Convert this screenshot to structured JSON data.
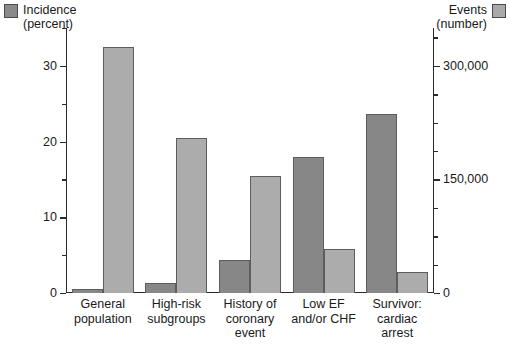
{
  "legend": {
    "left": {
      "label": "Incidence\n(percent)",
      "swatch": "legend-swatch-incidence",
      "color": "#8a8a8a"
    },
    "right": {
      "label": "Events\n(number)",
      "swatch": "legend-swatch-events",
      "color": "#a9a9a9"
    }
  },
  "axes": {
    "left": {
      "title": "Incidence (percent)",
      "major_ticks": [
        "0",
        "10",
        "20",
        "30"
      ],
      "minor_values": [
        5,
        15,
        25,
        35
      ],
      "min": 0,
      "max": 35
    },
    "right": {
      "title": "Events (number)",
      "major_ticks": [
        "0",
        "150,000",
        "300,000"
      ],
      "minor_values": [
        37500,
        75000,
        112500,
        187500,
        225000,
        262500,
        337500
      ],
      "min": 0,
      "max": 350000
    }
  },
  "chart_data": {
    "type": "bar",
    "title": "",
    "xlabel": "",
    "ylabel": "Incidence (percent)",
    "y2label": "Events (number)",
    "grid": false,
    "legend_position": "top-left and top-right",
    "ylim": [
      0,
      35
    ],
    "y2lim": [
      0,
      350000
    ],
    "categories": [
      "General\npopulation",
      "High-risk\nsubgroups",
      "History of\ncoronary\nevent",
      "Low EF\nand/or CHF",
      "Survivor:\ncardiac\narrest"
    ],
    "series": [
      {
        "name": "Incidence (percent)",
        "axis": "left",
        "color": "#878787",
        "units": "percent",
        "values": [
          0.5,
          1.3,
          4.4,
          18.0,
          23.6
        ]
      },
      {
        "name": "Events (number)",
        "axis": "right",
        "color": "#acacac",
        "units": "number",
        "values": [
          325000,
          205000,
          155000,
          58000,
          28000
        ]
      }
    ]
  }
}
